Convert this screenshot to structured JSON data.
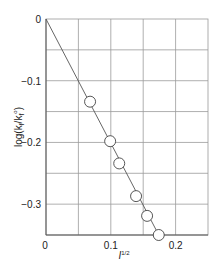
{
  "chart_data": {
    "type": "scatter",
    "title": "",
    "xlabel": "I^1/2",
    "ylabel": "log(k_f/k_f°)",
    "xlim": [
      0,
      0.25
    ],
    "ylim": [
      -0.35,
      0
    ],
    "grid": true,
    "legend": null,
    "x_ticks": [
      {
        "value": 0,
        "label": "0"
      },
      {
        "value": 0.1,
        "label": "0.1"
      },
      {
        "value": 0.2,
        "label": "0.2"
      }
    ],
    "y_ticks": [
      {
        "value": 0,
        "label": "0"
      },
      {
        "value": -0.1,
        "label": "−0.1"
      },
      {
        "value": -0.2,
        "label": "−0.2"
      },
      {
        "value": -0.3,
        "label": "−0.3"
      }
    ],
    "x_grid_step": 0.05,
    "y_grid_step": 0.05,
    "series": [
      {
        "name": "measured",
        "marker": "open-circle",
        "x": [
          0.068,
          0.099,
          0.113,
          0.139,
          0.156,
          0.174
        ],
        "y": [
          -0.134,
          -0.198,
          -0.234,
          -0.287,
          -0.319,
          -0.35
        ]
      }
    ],
    "fit_line": {
      "from": [
        0,
        0
      ],
      "to": [
        0.174,
        -0.35
      ],
      "slope": -2.01
    }
  },
  "colors": {
    "axis": "#555555",
    "grid": "#9a9a9a",
    "line": "#555555",
    "marker_stroke": "#444444",
    "marker_fill": "#ffffff",
    "text": "#222222"
  },
  "labels": {
    "xlabel_main": "I",
    "xlabel_sup": "1/2",
    "ylabel_prefix": "log(k",
    "ylabel_sub1": "f",
    "ylabel_mid": "/k",
    "ylabel_sub2": "f",
    "ylabel_sup": "o",
    "ylabel_suffix": ")"
  }
}
